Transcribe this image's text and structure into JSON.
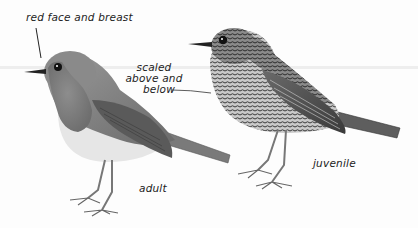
{
  "figure": {
    "style": "grayscale field-guide illustration",
    "subjects": [
      {
        "id": "adult",
        "caption": "adult"
      },
      {
        "id": "juvenile",
        "caption": "juvenile"
      }
    ],
    "annotations": {
      "red_face": "red face and breast",
      "scaled_line1": "scaled",
      "scaled_line2": "above and",
      "scaled_line3": "below"
    }
  }
}
